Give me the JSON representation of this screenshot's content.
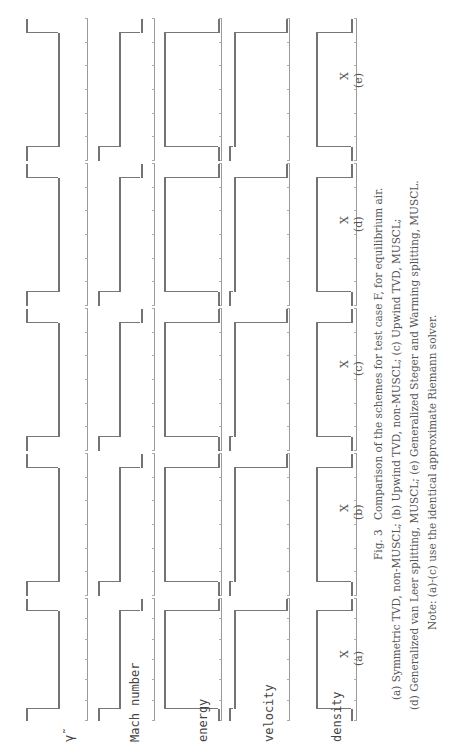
{
  "figure": {
    "number": "Fig. 3",
    "caption_title": "Comparison of the schemes for test case F, for equilibrium air.",
    "caption_lines": [
      "(a) Symmetric TVD, non-MUSCL;  (b) Upwind TVD, non-MUSCL;  (c) Upwind TVD, MUSCL;",
      "(d) Generalized van Leer splitting, MUSCL;  (e) Generalized Steger and Warming splitting, MUSCL.",
      "Note: (a)-(c) use the identical approximate Riemann solver."
    ],
    "orientation": "rotated 90° counter-clockwise"
  },
  "rows": [
    {
      "key": "gamma",
      "label": "γ̃"
    },
    {
      "key": "mach",
      "label": "Mach number"
    },
    {
      "key": "energy",
      "label": "energy"
    },
    {
      "key": "velocity",
      "label": "velocity"
    },
    {
      "key": "density",
      "label": "density"
    }
  ],
  "columns": [
    {
      "id": "a",
      "label": "(a)",
      "xlabel": "X"
    },
    {
      "id": "b",
      "label": "(b)",
      "xlabel": "X"
    },
    {
      "id": "c",
      "label": "(c)",
      "xlabel": "X"
    },
    {
      "id": "d",
      "label": "(d)",
      "xlabel": "X"
    },
    {
      "id": "e",
      "label": "(e)",
      "xlabel": "X"
    }
  ],
  "chart_data": {
    "type": "scatter",
    "title": "Comparison of the schemes for test case F, for equilibrium air",
    "layout": "5x5 grid of small multiples (rows: gamma, Mach number, energy, velocity, density; columns: schemes a-e)",
    "xlabel": "X",
    "x_range": [
      0,
      1
    ],
    "grid": false,
    "legend": "none",
    "profile_shape": "square pulse: low-high-low with two sharp discontinuities near x≈0.1 and x≈0.9",
    "series": [
      {
        "name": "gamma",
        "levels": {
          "outer": 1.4,
          "inner": 1.2
        },
        "step_positions": [
          0.1,
          0.9
        ]
      },
      {
        "name": "Mach number",
        "levels": {
          "outer_left": 6.3,
          "inner": 4.8,
          "outer_right": 3.0
        },
        "step_positions": [
          0.1,
          0.9
        ]
      },
      {
        "name": "energy",
        "levels": {
          "outer": 0.2,
          "inner": 1.0
        },
        "step_positions": [
          0.1,
          0.9
        ]
      },
      {
        "name": "velocity",
        "levels": {
          "outer": 1.0,
          "inner": 0.5
        },
        "step_positions": [
          0.1,
          0.9
        ]
      },
      {
        "name": "density",
        "levels": {
          "outer": 0.3,
          "inner": 1.0
        },
        "step_positions": [
          0.1,
          0.9
        ]
      }
    ]
  }
}
